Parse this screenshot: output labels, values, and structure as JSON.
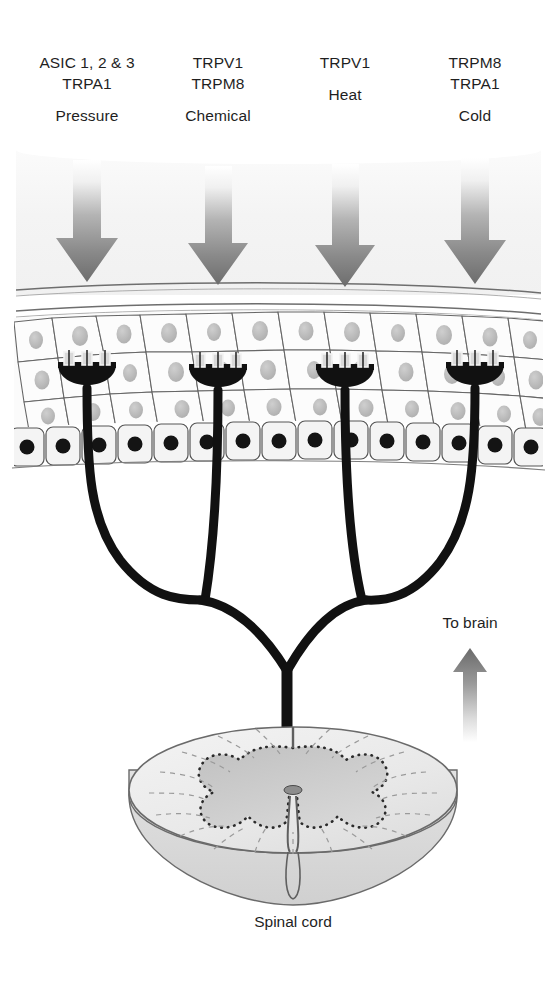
{
  "figure": {
    "columns": [
      {
        "id": "pressure",
        "receptors": "ASIC 1, 2 & 3",
        "receptors2": "TRPA1",
        "modality": "Pressure",
        "x": 87
      },
      {
        "id": "chemical",
        "receptors": "TRPV1",
        "receptors2": "TRPM8",
        "modality": "Chemical",
        "x": 218
      },
      {
        "id": "heat",
        "receptors": "TRPV1",
        "receptors2": "",
        "modality": "Heat",
        "x": 345
      },
      {
        "id": "cold",
        "receptors": "TRPM8",
        "receptors2": "TRPA1",
        "modality": "Cold",
        "x": 475
      }
    ],
    "to_brain_label": "To brain",
    "spinal_cord_label": "Spinal cord",
    "colors": {
      "arrow_dark": "#6f6f6f",
      "arrow_light": "#fdfdfd",
      "nerve_black": "#111111",
      "cell_outline": "#5a5a5a",
      "cell_fill": "#f7f7f7",
      "nucleus_light": "#b9b9b9",
      "nucleus_dark": "#141414",
      "cord_fill": "#ececec",
      "cord_gray_matter": "#c6c6c6",
      "cord_outline": "#6a6a6a",
      "text": "#1f1f1f"
    }
  }
}
